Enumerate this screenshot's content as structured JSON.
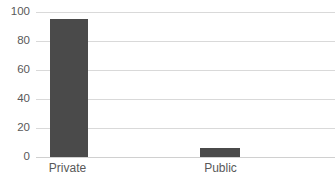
{
  "chart_data": {
    "type": "bar",
    "title": "",
    "subtitle": "",
    "xlabel": "",
    "ylabel": "",
    "categories": [
      "Private",
      "Public"
    ],
    "values": [
      95,
      6
    ],
    "series": [
      {
        "name": "",
        "values": [
          95,
          6
        ]
      }
    ],
    "ylim": [
      0,
      100
    ],
    "y_ticks": [
      0,
      20,
      40,
      60,
      80,
      100
    ],
    "y_tick_labels": [
      "0",
      "20",
      "40",
      "60",
      "80",
      "100"
    ],
    "grid": true,
    "grid_axis": "y",
    "legend": false,
    "legend_position": "none",
    "annotations": [],
    "colors": {
      "bar": "#4a4a4a",
      "gridline": "#d9d9d9",
      "axis": "#d0d0d0",
      "tick_label": "#595959",
      "background": "#ffffff"
    }
  }
}
